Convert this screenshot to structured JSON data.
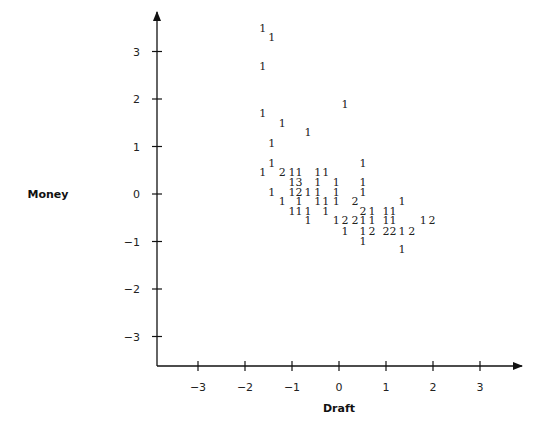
{
  "chart_data": {
    "type": "scatter",
    "title": "",
    "xlabel": "Draft",
    "ylabel": "Money",
    "xlim": [
      -3.8,
      3.8
    ],
    "ylim": [
      -3.6,
      3.8
    ],
    "x_ticks": [
      -3,
      -2,
      -1,
      0,
      1,
      2,
      3
    ],
    "y_ticks": [
      -3,
      -2,
      -1,
      0,
      1,
      2,
      3
    ],
    "x_tick_labels": [
      "−3",
      "−2",
      "−1",
      "0",
      "1",
      "2",
      "3"
    ],
    "y_tick_labels": [
      "−3",
      "−2",
      "−1",
      "0",
      "1",
      "2",
      "3"
    ],
    "grid": false,
    "legend": null,
    "marker_note": "Points plotted as count digits (number of observations at location)",
    "points": [
      {
        "x": -1.62,
        "y": 3.49,
        "label": "1"
      },
      {
        "x": -1.43,
        "y": 3.3,
        "label": "1"
      },
      {
        "x": -1.62,
        "y": 2.69,
        "label": "1"
      },
      {
        "x": 0.13,
        "y": 1.89,
        "label": "1"
      },
      {
        "x": -1.62,
        "y": 1.7,
        "label": "1"
      },
      {
        "x": -1.21,
        "y": 1.49,
        "label": "1"
      },
      {
        "x": -0.66,
        "y": 1.31,
        "label": "1"
      },
      {
        "x": -1.43,
        "y": 1.08,
        "label": "1"
      },
      {
        "x": -1.43,
        "y": 0.65,
        "label": "1"
      },
      {
        "x": 0.51,
        "y": 0.65,
        "label": "1"
      },
      {
        "x": -1.62,
        "y": 0.46,
        "label": "1"
      },
      {
        "x": -1.21,
        "y": 0.46,
        "label": "2"
      },
      {
        "x": -1.0,
        "y": 0.46,
        "label": "1"
      },
      {
        "x": -0.85,
        "y": 0.46,
        "label": "1"
      },
      {
        "x": -0.45,
        "y": 0.46,
        "label": "1"
      },
      {
        "x": -0.28,
        "y": 0.46,
        "label": "1"
      },
      {
        "x": -1.0,
        "y": 0.25,
        "label": "1"
      },
      {
        "x": -0.85,
        "y": 0.25,
        "label": "3"
      },
      {
        "x": -0.45,
        "y": 0.25,
        "label": "1"
      },
      {
        "x": -0.06,
        "y": 0.25,
        "label": "1"
      },
      {
        "x": 0.51,
        "y": 0.25,
        "label": "1"
      },
      {
        "x": -1.43,
        "y": 0.04,
        "label": "1"
      },
      {
        "x": -1.0,
        "y": 0.04,
        "label": "1"
      },
      {
        "x": -0.85,
        "y": 0.04,
        "label": "2"
      },
      {
        "x": -0.66,
        "y": 0.04,
        "label": "1"
      },
      {
        "x": -0.45,
        "y": 0.04,
        "label": "1"
      },
      {
        "x": -0.06,
        "y": 0.04,
        "label": "1"
      },
      {
        "x": 0.51,
        "y": 0.04,
        "label": "1"
      },
      {
        "x": -1.21,
        "y": -0.15,
        "label": "1"
      },
      {
        "x": -0.85,
        "y": -0.15,
        "label": "1"
      },
      {
        "x": -0.45,
        "y": -0.15,
        "label": "1"
      },
      {
        "x": -0.28,
        "y": -0.15,
        "label": "1"
      },
      {
        "x": -0.06,
        "y": -0.15,
        "label": "1"
      },
      {
        "x": 0.34,
        "y": -0.15,
        "label": "2"
      },
      {
        "x": 1.34,
        "y": -0.15,
        "label": "1"
      },
      {
        "x": -1.0,
        "y": -0.36,
        "label": "1"
      },
      {
        "x": -0.85,
        "y": -0.36,
        "label": "1"
      },
      {
        "x": -0.66,
        "y": -0.36,
        "label": "1"
      },
      {
        "x": -0.28,
        "y": -0.36,
        "label": "1"
      },
      {
        "x": 0.51,
        "y": -0.36,
        "label": "2"
      },
      {
        "x": 0.7,
        "y": -0.36,
        "label": "1"
      },
      {
        "x": 1.0,
        "y": -0.36,
        "label": "1"
      },
      {
        "x": 1.15,
        "y": -0.36,
        "label": "1"
      },
      {
        "x": -0.66,
        "y": -0.55,
        "label": "1"
      },
      {
        "x": -0.06,
        "y": -0.55,
        "label": "1"
      },
      {
        "x": 0.13,
        "y": -0.55,
        "label": "2"
      },
      {
        "x": 0.34,
        "y": -0.55,
        "label": "2"
      },
      {
        "x": 0.51,
        "y": -0.55,
        "label": "1"
      },
      {
        "x": 0.7,
        "y": -0.55,
        "label": "1"
      },
      {
        "x": 1.0,
        "y": -0.55,
        "label": "1"
      },
      {
        "x": 1.15,
        "y": -0.55,
        "label": "1"
      },
      {
        "x": 1.79,
        "y": -0.55,
        "label": "1"
      },
      {
        "x": 1.98,
        "y": -0.55,
        "label": "2"
      },
      {
        "x": 0.13,
        "y": -0.78,
        "label": "1"
      },
      {
        "x": 0.51,
        "y": -0.78,
        "label": "1"
      },
      {
        "x": 0.7,
        "y": -0.78,
        "label": "2"
      },
      {
        "x": 1.0,
        "y": -0.78,
        "label": "2"
      },
      {
        "x": 1.15,
        "y": -0.78,
        "label": "2"
      },
      {
        "x": 1.34,
        "y": -0.78,
        "label": "1"
      },
      {
        "x": 1.55,
        "y": -0.78,
        "label": "2"
      },
      {
        "x": 0.51,
        "y": -0.99,
        "label": "1"
      },
      {
        "x": 1.34,
        "y": -1.16,
        "label": "1"
      }
    ]
  },
  "axes": {
    "x_title": "Draft",
    "y_title": "Money"
  }
}
